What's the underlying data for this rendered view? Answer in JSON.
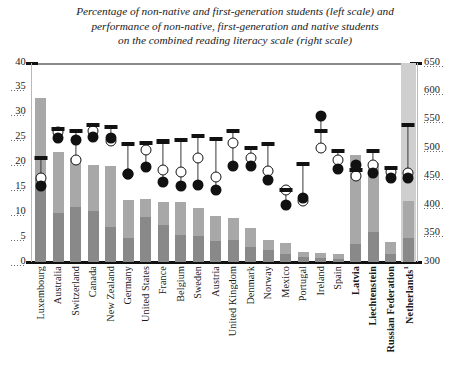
{
  "chart_data": {
    "type": "bar",
    "title": "Percentage of non-native and first-generation students (left scale) and performance of non-native, first-generation and native students on the combined reading literacy scale (right scale)",
    "title_lines": [
      "Percentage of non-native and first-generation students (left scale) and",
      "performance of non-native, first-generation and native students",
      "on the combined reading literacy scale (right scale)"
    ],
    "xlabel": "",
    "ylabel": "",
    "y2label": "",
    "ylim": [
      0,
      40
    ],
    "y2lim": [
      300,
      650
    ],
    "yticks": [
      0,
      5,
      10,
      15,
      20,
      25,
      30,
      35,
      40
    ],
    "y2ticks": [
      300,
      350,
      400,
      450,
      500,
      550,
      600,
      650
    ],
    "grid": false,
    "legend": "none",
    "categories": [
      "Luxembourg",
      "Australia",
      "Switzerland",
      "Canada",
      "New Zealand",
      "Germany",
      "United States",
      "France",
      "Belgium",
      "Sweden",
      "Austria",
      "United Kingdom",
      "Denmark",
      "Norway",
      "Mexico",
      "Portugal",
      "Ireland",
      "Spain",
      "Latvia",
      "Liechtenstein",
      "Russian Federation",
      "Netherlands"
    ],
    "categories_display": [
      "Luxembourg",
      "Australia",
      "Switzerland",
      "Canada",
      "New Zealand",
      "Germany",
      "United States",
      "France",
      "Belgium",
      "Sweden",
      "Austria",
      "United Kingdom",
      "Denmark",
      "Norway",
      "Mexico",
      "Portugal",
      "Ireland",
      "Spain",
      "Latvia",
      "Liechtenstein",
      "Russian Federation",
      "Netherlands¹"
    ],
    "bold_categories": [
      "Latvia",
      "Liechtenstein",
      "Russian Federation",
      "Netherlands¹"
    ],
    "highlighted_category": "Netherlands¹",
    "series": [
      {
        "name": "First-generation students (%)",
        "scale": "left",
        "marker": "bar-lower",
        "color": "#898989",
        "values": [
          16.8,
          9.8,
          11.0,
          10.2,
          7.0,
          4.8,
          9.0,
          7.5,
          5.5,
          5.2,
          4.2,
          4.4,
          3.0,
          2.4,
          1.6,
          1.1,
          0.9,
          0.6,
          3.6,
          6.0,
          1.7,
          4.8
        ]
      },
      {
        "name": "Non-native students (%)",
        "scale": "left",
        "marker": "bar-upper",
        "color": "#a8a8a8",
        "values": [
          16.2,
          12.4,
          10.0,
          9.4,
          12.3,
          7.6,
          3.6,
          4.5,
          6.5,
          5.6,
          5.0,
          4.4,
          3.8,
          2.1,
          2.3,
          0.9,
          0.9,
          1.1,
          18.0,
          14.0,
          2.3,
          7.5
        ]
      },
      {
        "name": "Native students (score)",
        "scale": "right",
        "marker": "dash",
        "color": "#111111",
        "values": [
          483,
          534,
          531,
          541,
          538,
          507,
          510,
          512,
          515,
          521,
          516,
          531,
          500,
          508,
          426,
          473,
          531,
          495,
          462,
          495,
          465,
          541
        ]
      },
      {
        "name": "First-generation students (score)",
        "scale": "right",
        "marker": "open-circle",
        "color": "#ffffff",
        "values": [
          447,
          528,
          480,
          531,
          513,
          455,
          497,
          462,
          459,
          483,
          450,
          509,
          483,
          460,
          427,
          408,
          501,
          480,
          452,
          471,
          458,
          456
        ]
      },
      {
        "name": "Non-native students (score)",
        "scale": "right",
        "marker": "filled-circle",
        "color": "#111111",
        "values": [
          433,
          518,
          515,
          520,
          518,
          455,
          467,
          441,
          434,
          436,
          426,
          469,
          469,
          445,
          400,
          412,
          557,
          463,
          470,
          457,
          447,
          447
        ]
      }
    ]
  }
}
